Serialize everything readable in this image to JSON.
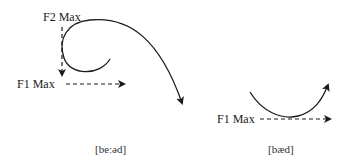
{
  "diagrams": [
    {
      "id": "left",
      "labels": {
        "f2": "F2 Max",
        "f1": "F1 Max"
      },
      "caption": "[beːəd]"
    },
    {
      "id": "right",
      "labels": {
        "f1": "F1 Max"
      },
      "caption": "[bæd]"
    }
  ],
  "colors": {
    "stroke": "#1a1a1a",
    "background": "#ffffff"
  }
}
